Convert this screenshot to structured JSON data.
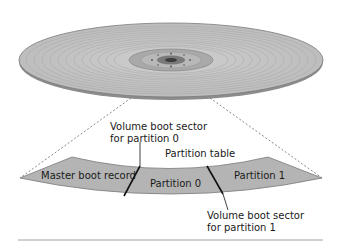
{
  "diagram": {
    "disk": {
      "name": "hard-disk-platter",
      "color": "#b9b9b9",
      "edge_color": "#6f6f6f"
    },
    "band": {
      "fill": "#b4b4b4",
      "stroke": "#7a7a7a"
    },
    "segments": [
      {
        "label": "Master boot record"
      },
      {
        "label": "Partition 0"
      },
      {
        "label": "Partition 1"
      }
    ],
    "callouts": {
      "vbs0_line1": "Volume boot sector",
      "vbs0_line2": "for partition 0",
      "partition_table": "Partition table",
      "vbs1_line1": "Volume boot sector",
      "vbs1_line2": "for partition 1"
    },
    "rule_color": "#8a8a8a"
  }
}
